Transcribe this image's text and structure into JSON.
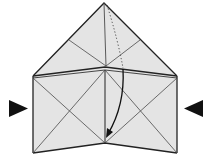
{
  "diagram": {
    "type": "origami-fold-step",
    "colors": {
      "paper": "#e4e4e4",
      "crease": "#4a4a4a",
      "edge": "#222222",
      "arrow": "#111111"
    },
    "indicators": [
      {
        "name": "push-arrow-left",
        "direction": "right"
      },
      {
        "name": "push-arrow-right",
        "direction": "left"
      }
    ],
    "fold_arrow": {
      "style": "dotted-then-solid",
      "direction": "down"
    }
  }
}
